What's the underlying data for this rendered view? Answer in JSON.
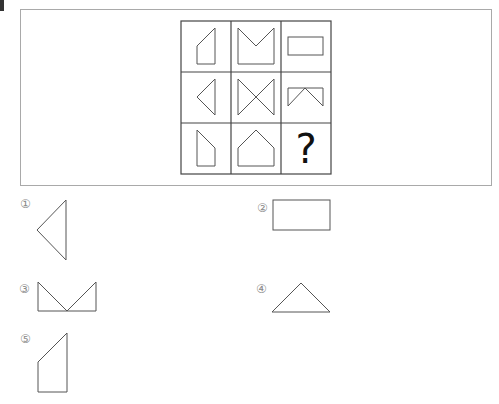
{
  "question": {
    "missing_cell_symbol": "?",
    "grid": {
      "rows": 3,
      "cols": 3,
      "cells": [
        {
          "row": 1,
          "col": 1,
          "shape": "pentagon-slanted-top-left"
        },
        {
          "row": 1,
          "col": 2,
          "shape": "m-notch-square"
        },
        {
          "row": 1,
          "col": 3,
          "shape": "rectangle"
        },
        {
          "row": 2,
          "col": 1,
          "shape": "triangle-pointing-left"
        },
        {
          "row": 2,
          "col": 2,
          "shape": "bowtie"
        },
        {
          "row": 2,
          "col": 3,
          "shape": "rectangle-with-inverted-v"
        },
        {
          "row": 3,
          "col": 1,
          "shape": "pentagon-slanted-top-right-corner"
        },
        {
          "row": 3,
          "col": 2,
          "shape": "house-pentagon"
        },
        {
          "row": 3,
          "col": 3,
          "shape": "question-mark"
        }
      ]
    }
  },
  "options": [
    {
      "label": "①",
      "shape": "triangle-pointing-left"
    },
    {
      "label": "②",
      "shape": "rectangle"
    },
    {
      "label": "③",
      "shape": "m-notch-wide"
    },
    {
      "label": "④",
      "shape": "triangle-up"
    },
    {
      "label": "⑤",
      "shape": "pentagon-slanted-top-left"
    }
  ],
  "colors": {
    "frame": "#a9a9a9",
    "grid_line": "#444444",
    "shape_line": "#555555",
    "option_label": "#8a8a8a"
  }
}
